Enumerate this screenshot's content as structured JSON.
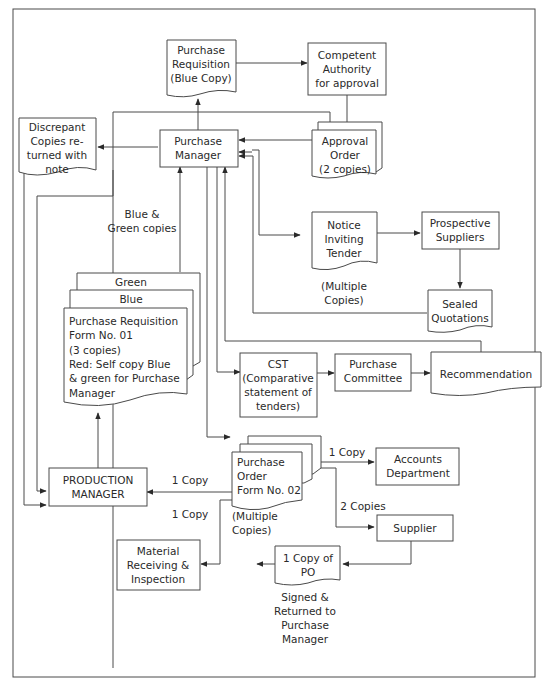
{
  "diagram": {
    "nodes": {
      "purchase_requisition_blue": {
        "lines": [
          "Purchase",
          "Requisition",
          "(Blue Copy)"
        ]
      },
      "competent_authority": {
        "lines": [
          "Competent",
          "Authority",
          "for approval"
        ]
      },
      "discrepant_copies": {
        "lines": [
          "Discrepant",
          "Copies re-",
          "turned with",
          "note"
        ]
      },
      "purchase_manager": {
        "lines": [
          "Purchase",
          "Manager"
        ]
      },
      "approval_order": {
        "lines": [
          "Approval",
          "Order",
          "(2 copies)"
        ]
      },
      "notice_inviting_tender": {
        "lines": [
          "Notice",
          "Inviting",
          "Tender"
        ]
      },
      "prospective_suppliers": {
        "lines": [
          "Prospective",
          "Suppliers"
        ]
      },
      "sealed_quotations": {
        "lines": [
          "Sealed",
          "Quotations"
        ]
      },
      "pr_form_green": {
        "label": "Green"
      },
      "pr_form_blue": {
        "label": "Blue"
      },
      "pr_form_01": {
        "lines": [
          "Purchase Requisition",
          "Form No. 01",
          "(3 copies)",
          "Red: Self copy Blue",
          "& green for Purchase",
          "Manager"
        ]
      },
      "cst": {
        "lines": [
          "CST",
          "(Comparative",
          "statement of",
          "tenders)"
        ]
      },
      "purchase_committee": {
        "lines": [
          "Purchase",
          "Committee"
        ]
      },
      "recommendation": {
        "lines": [
          "Recommendation"
        ]
      },
      "production_manager": {
        "lines": [
          "PRODUCTION",
          "MANAGER"
        ]
      },
      "purchase_order_02": {
        "lines": [
          "Purchase",
          "Order",
          "Form No. 02"
        ]
      },
      "accounts_department": {
        "lines": [
          "Accounts",
          "Department"
        ]
      },
      "supplier": {
        "lines": [
          "Supplier"
        ]
      },
      "material_receiving": {
        "lines": [
          "Material",
          "Receiving &",
          "Inspection"
        ]
      },
      "copy_of_po": {
        "lines": [
          "1 Copy of",
          "PO"
        ]
      }
    },
    "labels": {
      "blue_green_copies": [
        "Blue &",
        "Green copies"
      ],
      "multiple_copies_tender": [
        "(Multiple",
        "Copies)"
      ],
      "multiple_copies_po": [
        "(Multiple",
        "Copies)"
      ],
      "one_copy_production": "1 Copy",
      "one_copy_material": "1 Copy",
      "one_copy_accounts": "1 Copy",
      "two_copies_supplier": "2 Copies",
      "signed_returned": [
        "Signed &",
        "Returned to",
        "Purchase",
        "Manager"
      ]
    }
  }
}
